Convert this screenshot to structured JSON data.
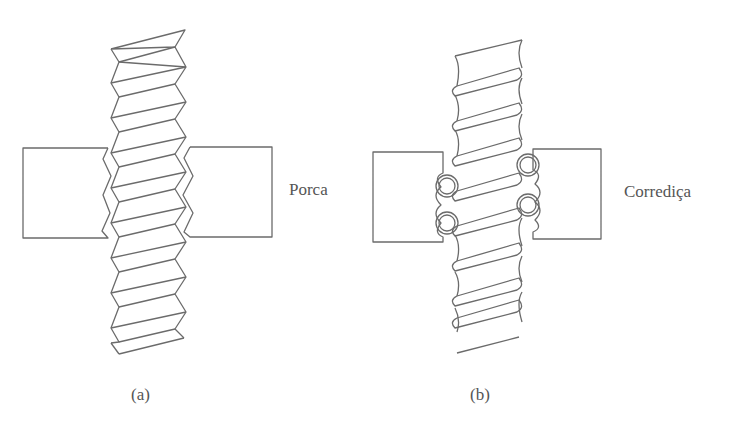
{
  "figure": {
    "panel_a": {
      "caption": "(a)",
      "label": "Porca",
      "description": "Parafuso com rosca trapezoidal engatado em porca"
    },
    "panel_b": {
      "caption": "(b)",
      "label": "Corrediça",
      "description": "Fuso de esferas com corrediça e esferas recirculantes"
    }
  },
  "colors": {
    "line": "#6b6b6b",
    "text": "#555555",
    "background": "#ffffff"
  }
}
